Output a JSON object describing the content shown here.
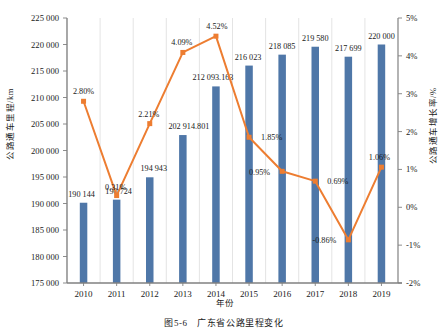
{
  "caption": "图5-6　广东省公路里程变化",
  "axes": {
    "x_title": "年份",
    "y_left_title": "公路通车里程/km",
    "y_right_title": "公路通车增长率/%"
  },
  "colors": {
    "bar": "#4f77a8",
    "line": "#ED7D31",
    "axis": "#808080",
    "grid": "#d9d9d9",
    "text": "#1a1a1a"
  },
  "chart_data": {
    "type": "bar",
    "title": "图5-6　广东省公路里程变化",
    "xlabel": "年份",
    "ylabel": "公路通车里程/km",
    "y2label": "公路通车增长率/%",
    "grid": true,
    "legend": "none",
    "categories": [
      "2010",
      "2011",
      "2012",
      "2013",
      "2014",
      "2015",
      "2016",
      "2017",
      "2018",
      "2019"
    ],
    "ylim": [
      175000,
      225000
    ],
    "yticks": [
      "175 000",
      "180 000",
      "185 000",
      "190 000",
      "195 000",
      "200 000",
      "205 000",
      "210 000",
      "215 000",
      "220 000",
      "225 000"
    ],
    "ytick_values": [
      175000,
      180000,
      185000,
      190000,
      195000,
      200000,
      205000,
      210000,
      215000,
      220000,
      225000
    ],
    "y2lim": [
      -2,
      5
    ],
    "y2ticks": [
      "-2%",
      "-1%",
      "0%",
      "1%",
      "2%",
      "3%",
      "4%",
      "5%"
    ],
    "y2tick_values": [
      -2,
      -1,
      0,
      1,
      2,
      3,
      4,
      5
    ],
    "series": [
      {
        "name": "公路通车里程",
        "type": "bar",
        "axis": "left",
        "values": [
          190144,
          190724,
          194943,
          202914.801,
          212093.163,
          216023,
          218085,
          219580,
          217699,
          220000
        ],
        "labels": [
          "190 144",
          "190 724",
          "194 943",
          "202 914.801",
          "212 093.163",
          "216 023",
          "218 085",
          "219 580",
          "217 699",
          "220 000"
        ]
      },
      {
        "name": "公路通车增长率",
        "type": "line",
        "axis": "right",
        "values": [
          2.8,
          0.31,
          2.21,
          4.09,
          4.52,
          1.85,
          0.95,
          0.69,
          -0.86,
          1.06
        ],
        "labels": [
          "2.80%",
          "0.31%",
          "2.21%",
          "4.09%",
          "4.52%",
          "1.85%",
          "0.95%",
          "0.69%",
          "-0.86%",
          "1.06%"
        ]
      }
    ]
  }
}
